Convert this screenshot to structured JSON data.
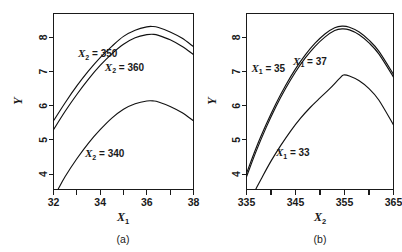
{
  "figure": {
    "background": "#ffffff",
    "ink": "#1a1a1a",
    "panel_count": 2
  },
  "chart_data": [
    {
      "type": "line",
      "panel_id": "a",
      "caption": "(a)",
      "title": "",
      "xlabel": "X1",
      "xlabel_base": "X",
      "xlabel_sub": "1",
      "ylabel": "Y",
      "xlim": [
        32,
        38
      ],
      "ylim": [
        3.55,
        8.7
      ],
      "xticks": [
        32,
        33,
        34,
        35,
        36,
        37,
        38
      ],
      "xticklabels": [
        "32",
        "",
        "34",
        "",
        "36",
        "",
        "38"
      ],
      "yticks": [
        4,
        5,
        6,
        7,
        8
      ],
      "yticklabels": [
        "4",
        "5",
        "6",
        "7",
        "8"
      ],
      "grid": false,
      "legend_position": "inline-annotations",
      "series": [
        {
          "name": "X2 = 350",
          "label_base": "X",
          "label_sub": "2",
          "label_rest": " = 350",
          "annotation_x": 33.05,
          "annotation_y": 7.42,
          "x": [
            32.0,
            32.5,
            33.0,
            33.5,
            34.0,
            34.5,
            35.0,
            35.5,
            36.0,
            36.25,
            36.5,
            37.0,
            37.5,
            38.0
          ],
          "y": [
            5.56,
            6.09,
            6.58,
            7.02,
            7.41,
            7.74,
            8.03,
            8.21,
            8.31,
            8.32,
            8.29,
            8.16,
            7.98,
            7.73
          ]
        },
        {
          "name": "X2 = 360",
          "label_base": "X",
          "label_sub": "2",
          "label_rest": " = 360",
          "annotation_x": 34.2,
          "annotation_y": 7.02,
          "x": [
            32.0,
            32.5,
            33.0,
            33.5,
            34.0,
            34.5,
            35.0,
            35.5,
            36.0,
            36.3,
            36.5,
            37.0,
            37.5,
            38.0
          ],
          "y": [
            5.3,
            5.84,
            6.33,
            6.78,
            7.18,
            7.52,
            7.8,
            7.99,
            8.08,
            8.09,
            8.06,
            7.93,
            7.74,
            7.5
          ]
        },
        {
          "name": "X2 = 340",
          "label_base": "X",
          "label_sub": "2",
          "label_rest": " = 340",
          "annotation_x": 33.35,
          "annotation_y": 4.5,
          "x": [
            32.2,
            32.5,
            33.0,
            33.5,
            34.0,
            34.5,
            35.0,
            35.5,
            36.0,
            36.3,
            36.5,
            37.0,
            37.5,
            38.0
          ],
          "y": [
            3.56,
            3.93,
            4.45,
            4.91,
            5.3,
            5.64,
            5.9,
            6.06,
            6.14,
            6.14,
            6.11,
            5.98,
            5.8,
            5.56
          ]
        }
      ]
    },
    {
      "type": "line",
      "panel_id": "b",
      "caption": "(b)",
      "title": "",
      "xlabel": "X2",
      "xlabel_base": "X",
      "xlabel_sub": "2",
      "ylabel": "Y",
      "xlim": [
        335,
        365
      ],
      "ylim": [
        3.55,
        8.7
      ],
      "xticks": [
        335,
        340,
        345,
        350,
        355,
        360,
        365
      ],
      "xticklabels": [
        "335",
        "",
        "345",
        "",
        "355",
        "",
        "365"
      ],
      "yticks": [
        4,
        5,
        6,
        7,
        8
      ],
      "yticklabels": [
        "4",
        "5",
        "6",
        "7",
        "8"
      ],
      "grid": false,
      "legend_position": "inline-annotations",
      "series": [
        {
          "name": "X1 = 35",
          "label_base": "X",
          "label_sub": "1",
          "label_rest": " = 35",
          "annotation_x": 336.0,
          "annotation_y": 7.0,
          "x": [
            335.0,
            337.0,
            339.0,
            341.0,
            343.0,
            345.0,
            347.0,
            349.0,
            351.0,
            353.0,
            354.5,
            356.0,
            358.0,
            360.0,
            362.0,
            365.0
          ],
          "y": [
            4.02,
            4.78,
            5.45,
            6.06,
            6.6,
            7.08,
            7.49,
            7.83,
            8.1,
            8.28,
            8.33,
            8.3,
            8.16,
            7.92,
            7.6,
            6.92
          ]
        },
        {
          "name": "X1 = 37",
          "label_base": "X",
          "label_sub": "1",
          "label_rest": " = 37",
          "annotation_x": 344.5,
          "annotation_y": 7.2,
          "x": [
            335.0,
            337.0,
            339.0,
            341.0,
            343.0,
            345.0,
            347.0,
            349.0,
            351.0,
            353.0,
            354.5,
            356.0,
            358.0,
            360.0,
            362.0,
            365.0
          ],
          "y": [
            3.92,
            4.68,
            5.36,
            5.97,
            6.51,
            6.99,
            7.4,
            7.74,
            8.01,
            8.2,
            8.25,
            8.22,
            8.08,
            7.84,
            7.52,
            6.84
          ]
        },
        {
          "name": "X1 = 33",
          "label_base": "X",
          "label_sub": "1",
          "label_rest": " = 33",
          "annotation_x": 341.0,
          "annotation_y": 4.52,
          "x": [
            336.9,
            338.0,
            340.0,
            342.0,
            344.0,
            346.0,
            348.0,
            350.0,
            352.0,
            354.0,
            354.8,
            356.0,
            358.0,
            360.0,
            362.0,
            365.0
          ],
          "y": [
            3.56,
            3.86,
            4.38,
            4.84,
            5.26,
            5.63,
            5.95,
            6.23,
            6.5,
            6.8,
            6.9,
            6.87,
            6.73,
            6.5,
            6.17,
            5.44
          ]
        }
      ]
    }
  ]
}
